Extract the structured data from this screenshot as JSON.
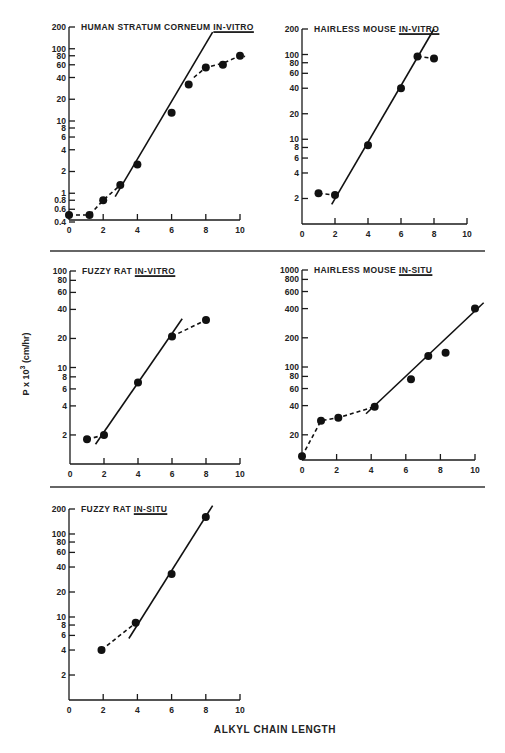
{
  "figure": {
    "xlabel": "ALKYL CHAIN LENGTH",
    "ylabel_prefix": "P x 10",
    "ylabel_exp": "3",
    "ylabel_unit": " (cm/hr)"
  },
  "chart_data": [
    {
      "type": "scatter",
      "title": "HUMAN STRATUM CORNEUM",
      "title_emph": "IN-VITRO",
      "xlabel": "ALKYL CHAIN LENGTH",
      "ylabel": "P x 10^3 (cm/hr)",
      "yscale": "log",
      "xlim": [
        0,
        10
      ],
      "ylim": [
        0.4,
        200
      ],
      "xticks": [
        0,
        2,
        4,
        6,
        8,
        10
      ],
      "yticks": [
        0.4,
        0.6,
        0.8,
        1,
        2,
        4,
        6,
        8,
        10,
        20,
        40,
        60,
        80,
        100,
        200
      ],
      "ytick_labels": [
        "0.4",
        "0.6",
        "0.8",
        "1",
        "2",
        "4",
        "6",
        "8",
        "10",
        "20",
        "40",
        "60",
        "80",
        "100",
        "200"
      ],
      "points": [
        [
          0,
          0.5
        ],
        [
          1.2,
          0.5
        ],
        [
          2,
          0.8
        ],
        [
          3,
          1.3
        ],
        [
          4,
          2.5
        ],
        [
          6,
          13
        ],
        [
          7,
          32
        ],
        [
          8,
          55
        ],
        [
          9,
          60
        ],
        [
          10,
          80
        ]
      ],
      "fit_line": [
        [
          2.7,
          0.9
        ],
        [
          8.4,
          170
        ]
      ],
      "dashed_segments": [
        [
          [
            0,
            0.5
          ],
          [
            1.2,
            0.5
          ],
          [
            2,
            0.8
          ],
          [
            3,
            1.3
          ]
        ],
        [
          [
            7.3,
            40
          ],
          [
            8,
            55
          ],
          [
            9,
            63
          ],
          [
            10,
            80
          ],
          [
            10.3,
            78
          ]
        ]
      ],
      "frame": {
        "x0": 69,
        "x1": 240,
        "yTop": 27,
        "yBottom": 222,
        "axisY": 220
      }
    },
    {
      "type": "scatter",
      "title": "HAIRLESS MOUSE",
      "title_emph": "IN-VITRO",
      "xlabel": "ALKYL CHAIN LENGTH",
      "ylabel": "P x 10^3 (cm/hr)",
      "yscale": "log",
      "xlim": [
        0,
        10
      ],
      "ylim": [
        1,
        200
      ],
      "xticks": [
        0,
        2,
        4,
        6,
        8,
        10
      ],
      "yticks": [
        2,
        4,
        6,
        8,
        10,
        20,
        40,
        60,
        80,
        100,
        200
      ],
      "ytick_labels": [
        "2",
        "4",
        "6",
        "8",
        "10",
        "20",
        "40",
        "60",
        "80",
        "100",
        "200"
      ],
      "points": [
        [
          1,
          2.3
        ],
        [
          2,
          2.2
        ],
        [
          4,
          8.5
        ],
        [
          6,
          40
        ],
        [
          7,
          95
        ],
        [
          8,
          90
        ]
      ],
      "fit_line": [
        [
          1.8,
          1.7
        ],
        [
          8,
          200
        ]
      ],
      "dashed_segments": [
        [
          [
            1,
            2.3
          ],
          [
            2,
            2.2
          ]
        ],
        [
          [
            7,
            95
          ],
          [
            8,
            90
          ]
        ]
      ],
      "frame": {
        "x0": 302,
        "x1": 467,
        "yTop": 29,
        "yBottom": 224,
        "axisY": 224
      }
    },
    {
      "type": "scatter",
      "title": "FUZZY RAT",
      "title_emph": "IN-VITRO",
      "xlabel": "ALKYL CHAIN LENGTH",
      "ylabel": "P x 10^3 (cm/hr)",
      "yscale": "log",
      "xlim": [
        0,
        10
      ],
      "ylim": [
        1,
        100
      ],
      "xticks": [
        0,
        2,
        4,
        6,
        8,
        10
      ],
      "yticks": [
        2,
        4,
        6,
        8,
        10,
        20,
        40,
        60,
        80,
        100
      ],
      "ytick_labels": [
        "2",
        "4",
        "6",
        "8",
        "10",
        "20",
        "40",
        "60",
        "80",
        "100"
      ],
      "points": [
        [
          1,
          1.8
        ],
        [
          2,
          2
        ],
        [
          4,
          7
        ],
        [
          6,
          21
        ],
        [
          8,
          31
        ]
      ],
      "fit_line": [
        [
          1.5,
          1.6
        ],
        [
          6.6,
          32
        ]
      ],
      "dashed_segments": [
        [
          [
            1,
            1.8
          ],
          [
            2,
            2
          ]
        ],
        [
          [
            6,
            21
          ],
          [
            8,
            31
          ]
        ]
      ],
      "frame": {
        "x0": 70,
        "x1": 240,
        "yTop": 271,
        "yBottom": 464,
        "axisY": 464
      }
    },
    {
      "type": "scatter",
      "title": "HAIRLESS MOUSE",
      "title_emph": "IN-SITU",
      "xlabel": "ALKYL CHAIN LENGTH",
      "ylabel": "P x 10^3 (cm/hr)",
      "yscale": "log",
      "xlim": [
        0,
        10
      ],
      "ylim": [
        11,
        1000
      ],
      "xticks": [
        0,
        2,
        4,
        6,
        8,
        10
      ],
      "yticks": [
        20,
        40,
        60,
        80,
        100,
        200,
        400,
        600,
        800,
        1000
      ],
      "ytick_labels": [
        "20",
        "40",
        "60",
        "80",
        "100",
        "200",
        "400",
        "600",
        "800",
        "1000"
      ],
      "points": [
        [
          0,
          12
        ],
        [
          1.1,
          28
        ],
        [
          2.1,
          30
        ],
        [
          4.2,
          39
        ],
        [
          6.3,
          75
        ],
        [
          7.3,
          130
        ],
        [
          8.3,
          140
        ],
        [
          10,
          400
        ]
      ],
      "fit_line": [
        [
          3.7,
          33
        ],
        [
          10.5,
          460
        ]
      ],
      "dashed_segments": [
        [
          [
            0,
            12
          ],
          [
            1.1,
            28
          ],
          [
            2.1,
            30
          ],
          [
            4.2,
            39
          ]
        ]
      ],
      "frame": {
        "x0": 302,
        "x1": 475,
        "yTop": 270,
        "yBottom": 460,
        "axisY": 460
      }
    },
    {
      "type": "scatter",
      "title": "FUZZY RAT",
      "title_emph": "IN-SITU",
      "xlabel": "ALKYL CHAIN LENGTH",
      "ylabel": "P x 10^3 (cm/hr)",
      "yscale": "log",
      "xlim": [
        0,
        10
      ],
      "ylim": [
        1,
        200
      ],
      "xticks": [
        0,
        2,
        4,
        6,
        8,
        10
      ],
      "yticks": [
        2,
        4,
        6,
        8,
        10,
        20,
        40,
        60,
        80,
        100,
        200
      ],
      "ytick_labels": [
        "2",
        "4",
        "6",
        "8",
        "10",
        "20",
        "40",
        "60",
        "80",
        "100",
        "200"
      ],
      "points": [
        [
          1.9,
          4
        ],
        [
          3.9,
          8.5
        ],
        [
          6,
          33
        ],
        [
          8,
          160
        ]
      ],
      "fit_line": [
        [
          3.5,
          5.5
        ],
        [
          8.4,
          220
        ]
      ],
      "dashed_segments": [
        [
          [
            1.9,
            4
          ],
          [
            3.9,
            8.5
          ]
        ]
      ],
      "frame": {
        "x0": 69,
        "x1": 240,
        "yTop": 509,
        "yBottom": 700,
        "axisY": 700
      }
    }
  ],
  "dividers": [
    {
      "y": 251,
      "x1": 50,
      "x2": 485
    },
    {
      "y": 487,
      "x1": 50,
      "x2": 485
    }
  ]
}
